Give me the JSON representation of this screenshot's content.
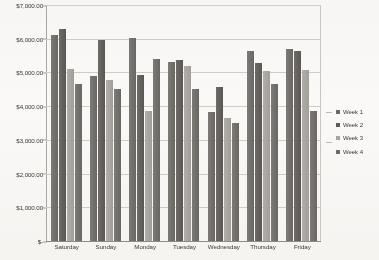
{
  "chart_data": {
    "type": "bar",
    "title": "",
    "subtitle": "",
    "xlabel": "",
    "ylabel": "",
    "categories": [
      "Saturday",
      "Sunday",
      "Monday",
      "Tuesday",
      "Wednesday",
      "Thursday",
      "Friday"
    ],
    "series": [
      {
        "name": "Week 1",
        "color": "#6e6b67",
        "values": [
          6100,
          4900,
          6030,
          5300,
          3830,
          5630,
          5700
        ]
      },
      {
        "name": "Week 2",
        "color": "#5e5b57",
        "values": [
          6280,
          5970,
          4930,
          5370,
          4570,
          5290,
          5640
        ]
      },
      {
        "name": "Week 3",
        "color": "#a8a5a0",
        "values": [
          5100,
          4780,
          3870,
          5190,
          3640,
          5030,
          5080
        ]
      },
      {
        "name": "Week 4",
        "color": "#6e6b67",
        "values": [
          4650,
          4500,
          5400,
          4500,
          3500,
          4670,
          3870
        ]
      }
    ],
    "ylim": [
      0,
      7000
    ],
    "ytick_values": [
      0,
      1000,
      2000,
      3000,
      4000,
      5000,
      6000,
      7000
    ],
    "ytick_labels": [
      "$-",
      "$1,000.00",
      "$2,000.00",
      "$3,000.00",
      "$4,000.00",
      "$5,000.00",
      "$6,000.00",
      "$7,000.00"
    ],
    "grid": true,
    "grid_axis": "y",
    "legend_position": "right",
    "legend_entries": [
      "Week 1",
      "Week 2",
      "Week 3",
      "Week 4"
    ],
    "plot_background": "#ffffff",
    "grid_color": "#cfccc7",
    "axis_color": "#8f8c87"
  }
}
